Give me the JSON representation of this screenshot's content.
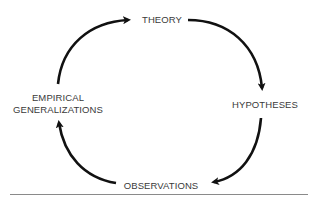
{
  "diagram": {
    "nodes": [
      {
        "id": "theory",
        "label": "THEORY"
      },
      {
        "id": "hypotheses",
        "label": "HYPOTHESES"
      },
      {
        "id": "observations",
        "label": "OBSERVATIONS"
      },
      {
        "id": "empirical",
        "label_line1": "EMPIRICAL",
        "label_line2": "GENERALIZATIONS"
      }
    ],
    "edges": [
      {
        "from": "empirical",
        "to": "theory"
      },
      {
        "from": "theory",
        "to": "hypotheses"
      },
      {
        "from": "hypotheses",
        "to": "observations"
      },
      {
        "from": "observations",
        "to": "empirical"
      }
    ],
    "colors": {
      "arrow": "#111111",
      "text": "#3a3a3a",
      "rule": "#8a8a8a",
      "background": "#ffffff"
    }
  }
}
